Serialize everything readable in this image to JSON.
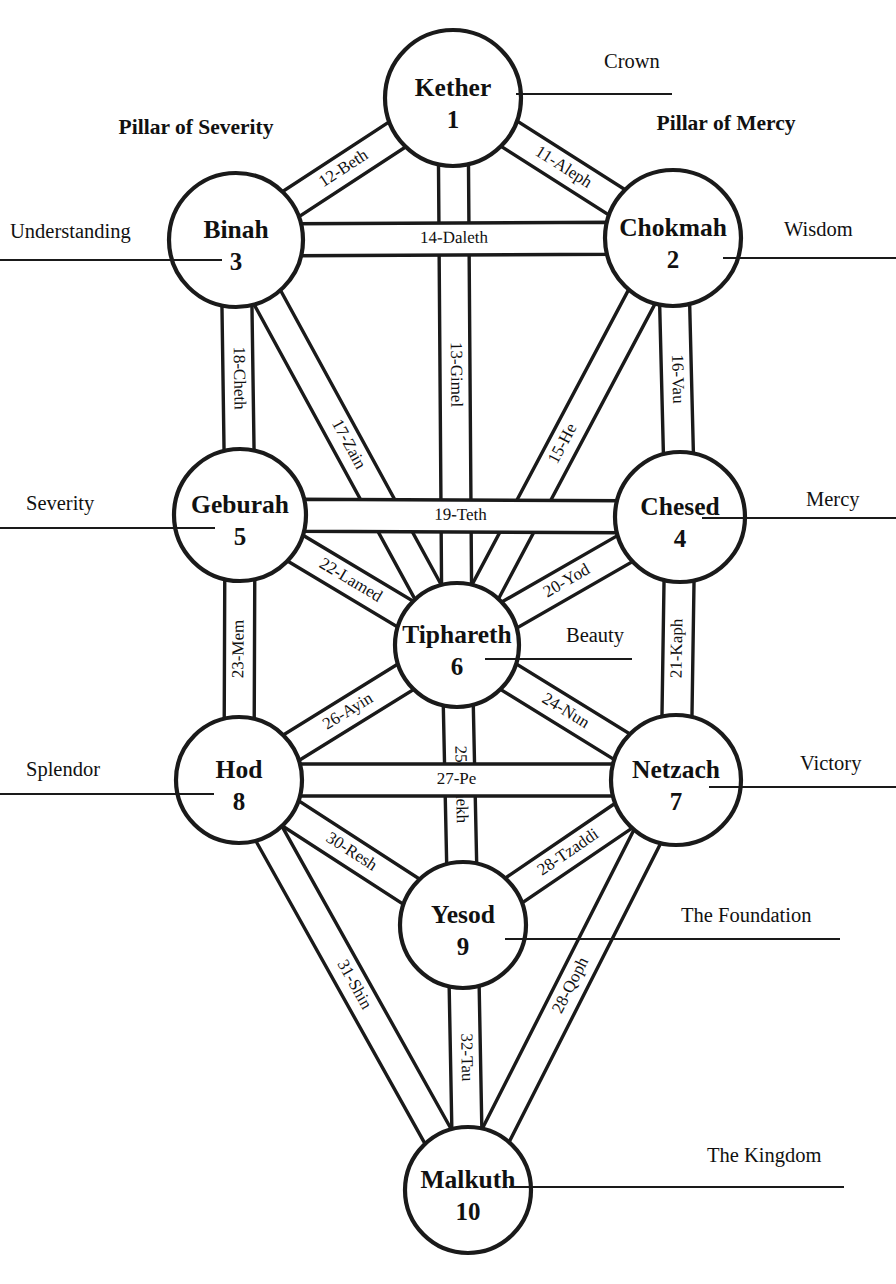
{
  "diagram": {
    "pillars": [
      {
        "label": "Pillar of Severity",
        "x": 196,
        "y": 134
      },
      {
        "label": "Pillar of Mercy",
        "x": 726,
        "y": 130
      }
    ],
    "sephirot": [
      {
        "key": "kether",
        "name": "Kether",
        "number": "1",
        "cx": 453,
        "cy": 98,
        "r": 68,
        "meaning": "Crown",
        "meaning_side": "right",
        "meaning_x": 604,
        "meaning_y": 68,
        "rule_x1": 516,
        "rule_x2": 672,
        "rule_y": 94
      },
      {
        "key": "chokmah",
        "name": "Chokmah",
        "number": "2",
        "cx": 673,
        "cy": 238,
        "r": 68,
        "meaning": "Wisdom",
        "meaning_side": "right",
        "meaning_x": 784,
        "meaning_y": 236,
        "rule_x1": 723,
        "rule_x2": 896,
        "rule_y": 258
      },
      {
        "key": "binah",
        "name": "Binah",
        "number": "3",
        "cx": 236,
        "cy": 240,
        "r": 67,
        "meaning": "Understanding",
        "meaning_side": "left",
        "meaning_x": 10,
        "meaning_y": 238,
        "rule_x1": 0,
        "rule_x2": 222,
        "rule_y": 260
      },
      {
        "key": "chesed",
        "name": "Chesed",
        "number": "4",
        "cx": 680,
        "cy": 517,
        "r": 65,
        "meaning": "Mercy",
        "meaning_side": "right",
        "meaning_x": 806,
        "meaning_y": 506,
        "rule_x1": 702,
        "rule_x2": 896,
        "rule_y": 518
      },
      {
        "key": "geburah",
        "name": "Geburah",
        "number": "5",
        "cx": 240,
        "cy": 515,
        "r": 66,
        "meaning": "Severity",
        "meaning_side": "left",
        "meaning_x": 26,
        "meaning_y": 510,
        "rule_x1": 0,
        "rule_x2": 215,
        "rule_y": 528
      },
      {
        "key": "tiphareth",
        "name": "Tiphareth",
        "number": "6",
        "cx": 457,
        "cy": 645,
        "r": 62,
        "meaning": "Beauty",
        "meaning_side": "right",
        "meaning_x": 566,
        "meaning_y": 642,
        "rule_x1": 485,
        "rule_x2": 632,
        "rule_y": 659
      },
      {
        "key": "netzach",
        "name": "Netzach",
        "number": "7",
        "cx": 676,
        "cy": 780,
        "r": 65,
        "meaning": "Victory",
        "meaning_side": "right",
        "meaning_x": 800,
        "meaning_y": 770,
        "rule_x1": 709,
        "rule_x2": 896,
        "rule_y": 787
      },
      {
        "key": "hod",
        "name": "Hod",
        "number": "8",
        "cx": 239,
        "cy": 780,
        "r": 63,
        "meaning": "Splendor",
        "meaning_side": "left",
        "meaning_x": 26,
        "meaning_y": 776,
        "rule_x1": 0,
        "rule_x2": 214,
        "rule_y": 794
      },
      {
        "key": "yesod",
        "name": "Yesod",
        "number": "9",
        "cx": 463,
        "cy": 925,
        "r": 63,
        "meaning": "The Foundation",
        "meaning_side": "right",
        "meaning_x": 681,
        "meaning_y": 922,
        "rule_x1": 505,
        "rule_x2": 840,
        "rule_y": 939
      },
      {
        "key": "malkuth",
        "name": "Malkuth",
        "number": "10",
        "cx": 468,
        "cy": 1190,
        "r": 63,
        "meaning": "The Kingdom",
        "meaning_side": "right",
        "meaning_x": 707,
        "meaning_y": 1162,
        "rule_x1": 509,
        "rule_x2": 844,
        "rule_y": 1187
      }
    ],
    "paths": [
      {
        "label": "11-Aleph",
        "from": "kether",
        "to": "chokmah",
        "w": 30,
        "flip": false
      },
      {
        "label": "12-Beth",
        "from": "kether",
        "to": "binah",
        "w": 30,
        "flip": true
      },
      {
        "label": "13-Gimel",
        "from": "kether",
        "to": "tiphareth",
        "w": 30,
        "flip": true
      },
      {
        "label": "14-Daleth",
        "from": "binah",
        "to": "chokmah",
        "w": 32,
        "flip": false
      },
      {
        "label": "15-He",
        "from": "chokmah",
        "to": "tiphareth",
        "w": 30,
        "flip": false
      },
      {
        "label": "16-Vau",
        "from": "chokmah",
        "to": "chesed",
        "w": 30,
        "flip": true
      },
      {
        "label": "17-Zain",
        "from": "binah",
        "to": "tiphareth",
        "w": 30,
        "flip": true
      },
      {
        "label": "18-Cheth",
        "from": "binah",
        "to": "geburah",
        "w": 30,
        "flip": true
      },
      {
        "label": "19-Teth",
        "from": "geburah",
        "to": "chesed",
        "w": 32,
        "flip": false
      },
      {
        "label": "20-Yod",
        "from": "chesed",
        "to": "tiphareth",
        "w": 30,
        "flip": false
      },
      {
        "label": "21-Kaph",
        "from": "chesed",
        "to": "netzach",
        "w": 30,
        "flip": true
      },
      {
        "label": "22-Lamed",
        "from": "geburah",
        "to": "tiphareth",
        "w": 30,
        "flip": true
      },
      {
        "label": "23-Mem",
        "from": "geburah",
        "to": "hod",
        "w": 30,
        "flip": true
      },
      {
        "label": "24-Nun",
        "from": "tiphareth",
        "to": "netzach",
        "w": 30,
        "flip": false
      },
      {
        "label": "25-Samekh",
        "from": "tiphareth",
        "to": "yesod",
        "w": 30,
        "flip": true
      },
      {
        "label": "26-Ayin",
        "from": "tiphareth",
        "to": "hod",
        "w": 30,
        "flip": true
      },
      {
        "label": "27-Pe",
        "from": "hod",
        "to": "netzach",
        "w": 32,
        "flip": false
      },
      {
        "label": "28-Tzaddi",
        "from": "netzach",
        "to": "yesod",
        "w": 30,
        "flip": true
      },
      {
        "label": "28-Qoph",
        "from": "netzach",
        "to": "malkuth",
        "w": 30,
        "flip": true
      },
      {
        "label": "30-Resh",
        "from": "hod",
        "to": "yesod",
        "w": 30,
        "flip": false
      },
      {
        "label": "31-Shin",
        "from": "hod",
        "to": "malkuth",
        "w": 30,
        "flip": false
      },
      {
        "label": "32-Tau",
        "from": "yesod",
        "to": "malkuth",
        "w": 30,
        "flip": true
      }
    ],
    "colors": {
      "ink": "#1a1a1a",
      "paper": "#ffffff"
    }
  }
}
